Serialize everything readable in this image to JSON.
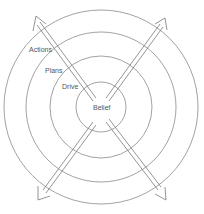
{
  "diagram": {
    "center": {
      "x": 101,
      "y": 107
    },
    "rings": [
      {
        "name": "belief",
        "label": "Belief",
        "r": 25
      },
      {
        "name": "drive",
        "label": "Drive",
        "r": 51
      },
      {
        "name": "plans",
        "label": "Plans",
        "r": 75
      },
      {
        "name": "actions",
        "label": "Actions",
        "r": 97
      }
    ],
    "labels": {
      "belief": "Belief",
      "drive": "Drive",
      "plans": "Plans",
      "actions": "Actions"
    },
    "arrows": [
      "north-west",
      "north-east",
      "south-west",
      "south-east"
    ],
    "colors": {
      "stroke": "#7a7a7a",
      "text": "#555555",
      "background": "#ffffff"
    }
  }
}
